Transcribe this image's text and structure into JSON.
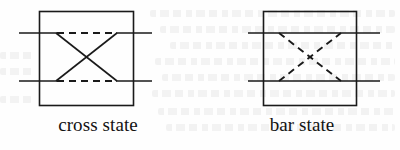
{
  "figure": {
    "background_color": "#fefefe",
    "stroke_color": "#1a1a1a",
    "panels": [
      {
        "id": "cross-state",
        "caption": "cross state",
        "box": {
          "x": 39,
          "y": 11,
          "width": 95,
          "height": 95
        },
        "waveguides": [
          {
            "name": "upper-input-port",
            "y": 33,
            "x1": 19,
            "x2": 56
          },
          {
            "name": "upper-output-port",
            "y": 33,
            "x1": 117,
            "x2": 152
          },
          {
            "name": "lower-input-port",
            "y": 81,
            "x1": 19,
            "x2": 56
          },
          {
            "name": "lower-output-port",
            "y": 81,
            "x1": 117,
            "x2": 152
          }
        ],
        "solid_paths": [
          {
            "name": "cross-path-down",
            "x1": 56,
            "y1": 33,
            "x2": 117,
            "y2": 81
          },
          {
            "name": "cross-path-up",
            "x1": 56,
            "y1": 81,
            "x2": 117,
            "y2": 33
          }
        ],
        "dashed_paths": [
          {
            "name": "bar-path-top-inactive",
            "x1": 56,
            "y1": 33,
            "x2": 117,
            "y2": 33
          },
          {
            "name": "bar-path-bottom-inactive",
            "x1": 56,
            "y1": 81,
            "x2": 117,
            "y2": 81
          }
        ],
        "active_routing": "crossed",
        "inactive_routing": "straight"
      },
      {
        "id": "bar-state",
        "caption": "bar state",
        "box": {
          "x": 263,
          "y": 11,
          "width": 94,
          "height": 95
        },
        "waveguides": [
          {
            "name": "upper-through-line",
            "y": 33,
            "x1": 248,
            "x2": 380
          },
          {
            "name": "lower-through-line",
            "y": 81,
            "x1": 248,
            "x2": 380
          }
        ],
        "solid_paths": [
          {
            "name": "bar-path-top-active",
            "x1": 248,
            "y1": 33,
            "x2": 380,
            "y2": 33
          },
          {
            "name": "bar-path-bottom-active",
            "x1": 248,
            "y1": 81,
            "x2": 380,
            "y2": 81
          }
        ],
        "dashed_paths": [
          {
            "name": "cross-path-down-inactive",
            "x1": 279,
            "y1": 33,
            "x2": 341,
            "y2": 81
          },
          {
            "name": "cross-path-up-inactive",
            "x1": 279,
            "y1": 81,
            "x2": 341,
            "y2": 33
          }
        ],
        "active_routing": "straight",
        "inactive_routing": "crossed"
      }
    ],
    "line_style": {
      "solid_width": 1.6,
      "dashed_width": 1.8,
      "box_width": 1.6,
      "dash_pattern": "7,5"
    }
  }
}
